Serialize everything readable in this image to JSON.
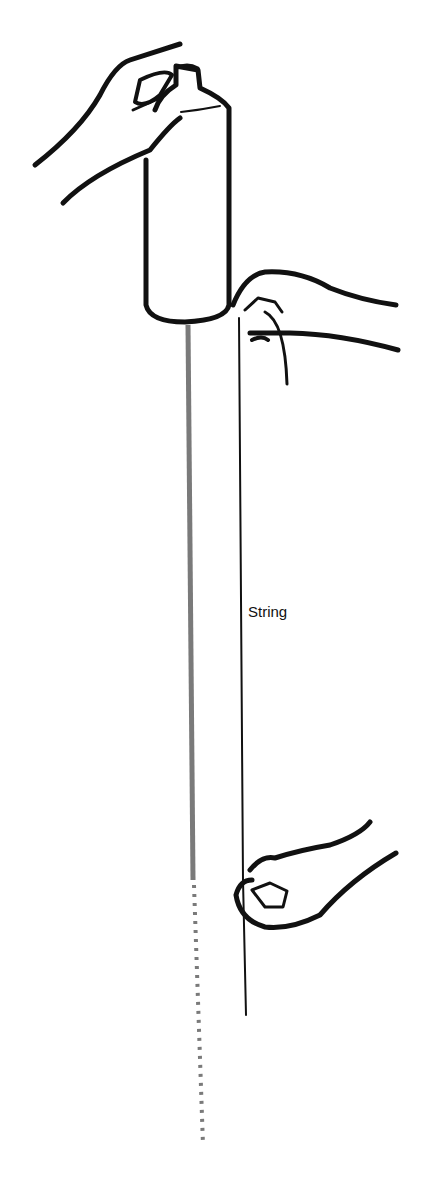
{
  "diagram": {
    "labels": {
      "string": "String"
    },
    "colors": {
      "ink": "#111111",
      "falling_stream": "#7a7a7a",
      "background": "#ffffff"
    }
  }
}
